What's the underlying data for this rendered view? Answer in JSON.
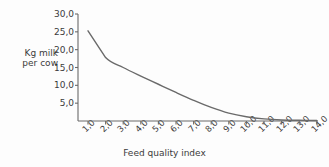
{
  "chart_data": {
    "type": "line",
    "title": "",
    "xlabel": "Feed quality index",
    "ylabel": "Kg milk per cow",
    "ylabel_line1": "Kg milk",
    "ylabel_line2": "per cow",
    "decimal_separator": ",",
    "grid": false,
    "legend": "none",
    "xlim": [
      0.5,
      14.5
    ],
    "ylim": [
      0,
      30
    ],
    "x_tick_labels": [
      "1,0",
      "2,0",
      "3,0",
      "4,0",
      "5,0",
      "6,0",
      "7,0",
      "8,0",
      "9,0",
      "10,0",
      "11,0",
      "12,0",
      "13,0",
      "14,0"
    ],
    "x_tick_values": [
      1,
      2,
      3,
      4,
      5,
      6,
      7,
      8,
      9,
      10,
      11,
      12,
      13,
      14
    ],
    "y_tick_labels": [
      "30,0",
      "25,0",
      "20,0",
      "15,0",
      "10,0",
      "5,0"
    ],
    "y_tick_values": [
      30,
      25,
      20,
      15,
      10,
      5
    ],
    "series": [
      {
        "name": "Kg milk per cow",
        "color": "#6a6a6a",
        "x": [
          1.0,
          2.0,
          3.0,
          4.0,
          5.0,
          6.0,
          7.0,
          8.0,
          9.0,
          10.0,
          11.0,
          12.0,
          13.0,
          14.0
        ],
        "values": [
          25.3,
          17.8,
          15.0,
          12.6,
          10.3,
          8.0,
          5.8,
          3.8,
          2.2,
          1.2,
          0.6,
          0.3,
          0.2,
          0.15
        ]
      }
    ]
  }
}
